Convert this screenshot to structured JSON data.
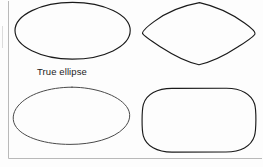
{
  "figure": {
    "background_color": "#ffffff",
    "ink_color": "#1a1a1a",
    "frame_color": "#b9b9b9",
    "caption": "True ellipse",
    "caption_position": {
      "x": 37,
      "y": 75
    },
    "frame": {
      "type": "L-shaped-border",
      "left_line": {
        "x": 8,
        "y1": 1,
        "y2": 158
      },
      "bottom_line": {
        "y": 158,
        "x1": 8,
        "x2": 262
      },
      "faint_left_mark": {
        "x": 2,
        "y1": 26,
        "y2": 48
      }
    },
    "shapes": [
      {
        "id": "shape-true-ellipse",
        "name": "true-ellipse",
        "label": "True ellipse",
        "position": "top-left",
        "bounds": {
          "x": 15,
          "y": 2,
          "width": 115,
          "height": 57
        },
        "description": "A mathematically true ellipse, wider than tall"
      },
      {
        "id": "shape-lens-oval",
        "name": "lens-pointed-oval",
        "label": "",
        "position": "top-right",
        "bounds": {
          "x": 142,
          "y": 2,
          "width": 114,
          "height": 63
        },
        "description": "Pointed oval / lens shape with rounded points left and right"
      },
      {
        "id": "shape-egg-ovoid",
        "name": "egg-ovoid",
        "label": "",
        "position": "bottom-left",
        "bounds": {
          "x": 14,
          "y": 87,
          "width": 116,
          "height": 57
        },
        "description": "Egg-like ovoid, flatter wide base with rounded raised top"
      },
      {
        "id": "shape-rounded-rectangle",
        "name": "rounded-rectangle",
        "label": "",
        "position": "bottom-right",
        "bounds": {
          "x": 142,
          "y": 88,
          "width": 114,
          "height": 64
        },
        "description": "Rounded rectangle with large corner radii, flat top and bottom"
      }
    ]
  }
}
